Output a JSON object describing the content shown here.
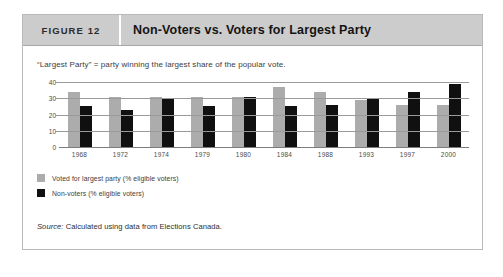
{
  "figure": {
    "tag": "FIGURE 12",
    "title": "Non-Voters vs. Voters for Largest Party",
    "subtitle": "“Largest Party” = party winning the largest share of the popular vote.",
    "source_prefix": "Source:",
    "source_text": " Calculated using data from Elections Canada."
  },
  "colors": {
    "series_gray": "#acacac",
    "series_black": "#101010",
    "header_band": "#cccccc",
    "card_border": "#b9b9b9",
    "gridline": "#9a9a9a"
  },
  "chart_data": {
    "type": "bar",
    "title": "Non-Voters vs. Voters for Largest Party",
    "subtitle": "“Largest Party” = party winning the largest share of the popular vote.",
    "xlabel": "",
    "ylabel": "",
    "ylim": [
      0,
      40
    ],
    "yticks": [
      40,
      30,
      20,
      10,
      0
    ],
    "grid": true,
    "legend_position": "below-left",
    "categories": [
      "1968",
      "1972",
      "1974",
      "1979",
      "1980",
      "1984",
      "1988",
      "1993",
      "1997",
      "2000"
    ],
    "series": [
      {
        "name": "Voted for largest party (% eligible voters)",
        "color": "#acacac",
        "values": [
          34,
          31,
          31,
          31,
          31,
          37,
          34,
          29,
          26,
          26
        ]
      },
      {
        "name": "Non-voters (% eligible voters)",
        "color": "#101010",
        "values": [
          25,
          23,
          30,
          25,
          31,
          25,
          26,
          30,
          34,
          39
        ]
      }
    ],
    "annotations": [
      "Source: Calculated using data from Elections Canada."
    ]
  }
}
